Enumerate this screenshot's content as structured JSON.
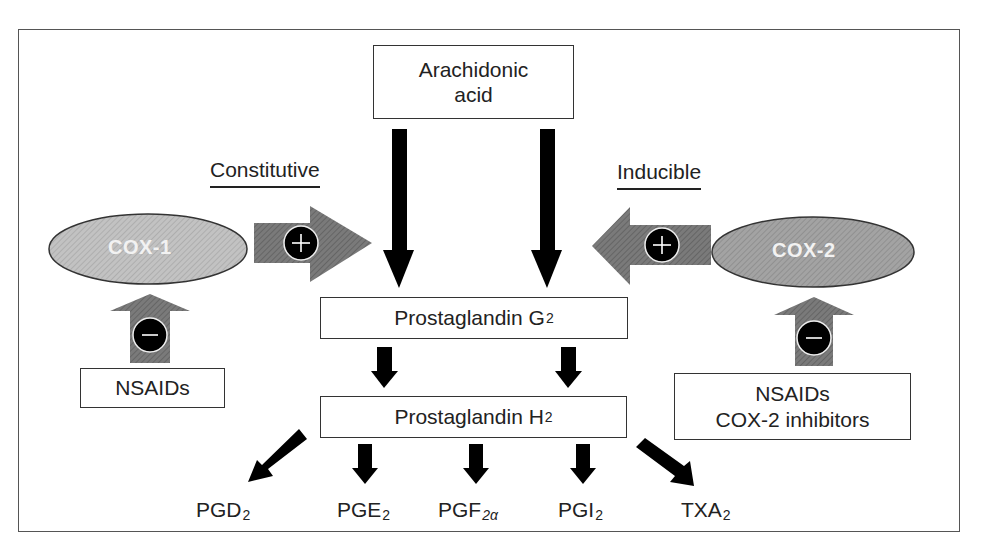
{
  "diagram": {
    "type": "pathway",
    "title": "",
    "colors": {
      "frame": "#555555",
      "arrow_black": "#000000",
      "arrow_gray": "#6e6e6e",
      "ellipse_fill": "#b5b5b5",
      "ellipse_cox2_fill": "#9a9a9a",
      "badge_fill": "#000000"
    }
  },
  "nodes": {
    "arachidonic_acid": {
      "line1": "Arachidonic",
      "line2": "acid"
    },
    "pgg2": {
      "text": "Prostaglandin G",
      "sub": "2"
    },
    "pgh2": {
      "text": "Prostaglandin H",
      "sub": "2"
    },
    "cox1": {
      "label": "COX-1"
    },
    "cox2": {
      "label": "COX-2"
    },
    "nsaids_left": {
      "text": "NSAIDs"
    },
    "nsaids_right": {
      "line1": "NSAIDs",
      "line2": "COX-2 inhibitors"
    }
  },
  "labels": {
    "constitutive": "Constitutive",
    "inducible": "Inducible",
    "plus_badge": "+",
    "minus_badge": "−"
  },
  "products": [
    {
      "base": "PGD",
      "sub": "2"
    },
    {
      "base": "PGE",
      "sub": "2"
    },
    {
      "base": "PGF",
      "sub": "2α"
    },
    {
      "base": "PGI",
      "sub": "2"
    },
    {
      "base": "TXA",
      "sub": "2"
    }
  ],
  "edges": [
    {
      "from": "Arachidonic acid",
      "to": "Prostaglandin G2",
      "style": "black-arrow"
    },
    {
      "from": "Arachidonic acid",
      "to": "Prostaglandin G2",
      "style": "black-arrow"
    },
    {
      "from": "COX-1",
      "to": "Prostaglandin G2",
      "style": "gray-block-arrow",
      "sign": "+"
    },
    {
      "from": "COX-2",
      "to": "Prostaglandin G2",
      "style": "gray-block-arrow",
      "sign": "+"
    },
    {
      "from": "NSAIDs",
      "to": "COX-1",
      "style": "gray-block-arrow",
      "sign": "-"
    },
    {
      "from": "NSAIDs / COX-2 inhibitors",
      "to": "COX-2",
      "style": "gray-block-arrow",
      "sign": "-"
    },
    {
      "from": "Prostaglandin G2",
      "to": "Prostaglandin H2",
      "style": "black-arrow"
    },
    {
      "from": "Prostaglandin H2",
      "to": "PGD2",
      "style": "black-arrow"
    },
    {
      "from": "Prostaglandin H2",
      "to": "PGE2",
      "style": "black-arrow"
    },
    {
      "from": "Prostaglandin H2",
      "to": "PGF2α",
      "style": "black-arrow"
    },
    {
      "from": "Prostaglandin H2",
      "to": "PGI2",
      "style": "black-arrow"
    },
    {
      "from": "Prostaglandin H2",
      "to": "TXA2",
      "style": "black-arrow"
    }
  ]
}
